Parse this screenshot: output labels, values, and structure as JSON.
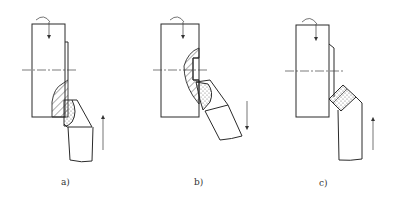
{
  "figures": [
    {
      "id": "a",
      "label": "a)",
      "feed_direction": "up"
    },
    {
      "id": "b",
      "label": "b)",
      "feed_direction": "down"
    },
    {
      "id": "c",
      "label": "c)",
      "feed_direction": "up"
    }
  ],
  "colors": {
    "line": "#2a2a2a",
    "background": "#ffffff"
  }
}
